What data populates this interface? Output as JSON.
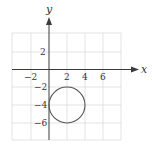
{
  "diagram": {
    "axes": {
      "x_label": "x",
      "y_label": "y",
      "x_ticks": [
        {
          "value": -2,
          "label": "−2"
        },
        {
          "value": 2,
          "label": "2"
        },
        {
          "value": 4,
          "label": "4"
        },
        {
          "value": 6,
          "label": "6"
        }
      ],
      "y_ticks": [
        {
          "value": 2,
          "label": "2"
        },
        {
          "value": -2,
          "label": "−2"
        },
        {
          "value": -4,
          "label": "−4"
        },
        {
          "value": -6,
          "label": "−6"
        }
      ],
      "grid_range_x": [
        -4,
        8
      ],
      "grid_range_y": [
        -8,
        4
      ],
      "grid_step": 2
    },
    "circle": {
      "center": [
        2,
        -4
      ],
      "radius": 2
    },
    "colors": {
      "grid": "#dcdcdc",
      "axis": "#3a3a3a",
      "circle": "#555555"
    }
  }
}
